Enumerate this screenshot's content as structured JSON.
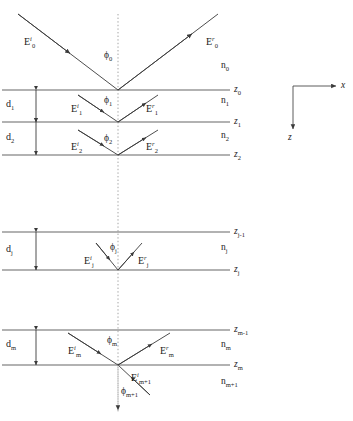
{
  "figure": {
    "type": "optical-multilayer-diagram",
    "canvas": {
      "width": 353,
      "height": 421,
      "background": "#ffffff"
    },
    "stroke_color": "#444444",
    "text_color": "#222222"
  },
  "axes": {
    "x_label": "x",
    "z_label": "z",
    "origin": {
      "x": 293,
      "y": 86
    },
    "x_arrow_end": {
      "x": 340,
      "y": 86
    },
    "z_arrow_end": {
      "x": 293,
      "y": 133
    }
  },
  "vertical_axis": {
    "x": 118,
    "top": 14,
    "bottom": 412,
    "style": "dotted-normal"
  },
  "interfaces": [
    {
      "name": "z0",
      "label": "z",
      "sub": "0",
      "y": 90,
      "x_start": 2,
      "x_end": 230
    },
    {
      "name": "z1",
      "label": "z",
      "sub": "1",
      "y": 122,
      "x_start": 2,
      "x_end": 230
    },
    {
      "name": "z2",
      "label": "z",
      "sub": "2",
      "y": 155,
      "x_start": 2,
      "x_end": 230
    },
    {
      "name": "zj-1",
      "label": "z",
      "sub": "j-1",
      "y": 232,
      "x_start": 2,
      "x_end": 230
    },
    {
      "name": "zj",
      "label": "z",
      "sub": "j",
      "y": 270,
      "x_start": 2,
      "x_end": 230
    },
    {
      "name": "zm-1",
      "label": "z",
      "sub": "m-1",
      "y": 330,
      "x_start": 2,
      "x_end": 230
    },
    {
      "name": "zm",
      "label": "z",
      "sub": "m",
      "y": 365,
      "x_start": 2,
      "x_end": 230
    }
  ],
  "refractive_indices": [
    {
      "name": "n0",
      "label": "n",
      "sub": "0",
      "x": 221,
      "y": 66
    },
    {
      "name": "n1",
      "label": "n",
      "sub": "1",
      "x": 221,
      "y": 101
    },
    {
      "name": "n2",
      "label": "n",
      "sub": "2",
      "x": 221,
      "y": 136
    },
    {
      "name": "nj",
      "label": "n",
      "sub": "j",
      "x": 221,
      "y": 248
    },
    {
      "name": "nm",
      "label": "n",
      "sub": "m",
      "x": 221,
      "y": 345
    },
    {
      "name": "nm+1",
      "label": "n",
      "sub": "m+1",
      "x": 221,
      "y": 382
    }
  ],
  "thicknesses": [
    {
      "name": "d1",
      "label": "d",
      "sub": "1",
      "x": 6,
      "y": 100,
      "arrow_x": 36,
      "top": 90,
      "bottom": 122
    },
    {
      "name": "d2",
      "label": "d",
      "sub": "2",
      "x": 6,
      "y": 133,
      "arrow_x": 36,
      "top": 122,
      "bottom": 155
    },
    {
      "name": "dj",
      "label": "d",
      "sub": "j",
      "x": 6,
      "y": 245,
      "arrow_x": 36,
      "top": 232,
      "bottom": 270
    },
    {
      "name": "dm",
      "label": "d",
      "sub": "m",
      "x": 6,
      "y": 340,
      "arrow_x": 36,
      "top": 330,
      "bottom": 365
    }
  ],
  "fields": [
    {
      "name": "E0-incident",
      "label": "E",
      "sup": "i",
      "sub": "0",
      "x": 24,
      "y": 41
    },
    {
      "name": "E0-reflected",
      "label": "E",
      "sup": "r",
      "sub": "0",
      "x": 206,
      "y": 41
    },
    {
      "name": "E1-incident",
      "label": "E",
      "sup": "i",
      "sub": "1",
      "x": 71,
      "y": 108
    },
    {
      "name": "E1-reflected",
      "label": "E",
      "sup": "r",
      "sub": "1",
      "x": 146,
      "y": 108
    },
    {
      "name": "E2-incident",
      "label": "E",
      "sup": "i",
      "sub": "2",
      "x": 71,
      "y": 146
    },
    {
      "name": "E2-reflected",
      "label": "E",
      "sup": "r",
      "sub": "2",
      "x": 146,
      "y": 146
    },
    {
      "name": "Ej-incident",
      "label": "E",
      "sup": "i",
      "sub": "j",
      "x": 84,
      "y": 260
    },
    {
      "name": "Ej-reflected",
      "label": "E",
      "sup": "r",
      "sub": "j",
      "x": 138,
      "y": 260
    },
    {
      "name": "Em-incident",
      "label": "E",
      "sup": "i",
      "sub": "m",
      "x": 68,
      "y": 350
    },
    {
      "name": "Em-reflected",
      "label": "E",
      "sup": "r",
      "sub": "m",
      "x": 160,
      "y": 350
    },
    {
      "name": "Em+1-transmitted",
      "label": "E",
      "sup": "i",
      "sub": "m+1",
      "x": 131,
      "y": 377
    }
  ],
  "angles": [
    {
      "name": "phi0",
      "label": "ϕ",
      "sub": "0",
      "x": 104,
      "y": 56
    },
    {
      "name": "phi1",
      "label": "ϕ",
      "sub": "1",
      "x": 104,
      "y": 101
    },
    {
      "name": "phi2",
      "label": "ϕ",
      "sub": "2",
      "x": 104,
      "y": 139
    },
    {
      "name": "phij",
      "label": "ϕ",
      "sub": "j",
      "x": 110,
      "y": 248
    },
    {
      "name": "phim",
      "label": "ϕ",
      "sub": "m",
      "x": 107,
      "y": 341
    },
    {
      "name": "phim+1",
      "label": "ϕ",
      "sub": "m+1",
      "x": 121,
      "y": 392
    }
  ],
  "rays": {
    "incident_top": {
      "from": [
        18,
        14
      ],
      "to": [
        118,
        90
      ]
    },
    "reflected_top": {
      "from": [
        118,
        90
      ],
      "to": [
        218,
        14
      ]
    },
    "incident_l1": {
      "from": [
        78,
        95
      ],
      "to": [
        118,
        122
      ]
    },
    "reflected_l1": {
      "from": [
        118,
        122
      ],
      "to": [
        158,
        95
      ]
    },
    "incident_l2": {
      "from": [
        78,
        130
      ],
      "to": [
        118,
        155
      ]
    },
    "reflected_l2": {
      "from": [
        118,
        155
      ],
      "to": [
        158,
        130
      ]
    },
    "incident_lj": {
      "from": [
        96,
        243
      ],
      "to": [
        118,
        270
      ]
    },
    "reflected_lj": {
      "from": [
        118,
        270
      ],
      "to": [
        142,
        243
      ]
    },
    "incident_lm": {
      "from": [
        68,
        333
      ],
      "to": [
        118,
        365
      ]
    },
    "reflected_lm": {
      "from": [
        118,
        365
      ],
      "to": [
        170,
        333
      ]
    },
    "transmitted": {
      "from": [
        150,
        395
      ],
      "to": [
        118,
        365
      ]
    },
    "normal_bottom": {
      "from": [
        118,
        365
      ],
      "to": [
        118,
        412
      ]
    }
  }
}
